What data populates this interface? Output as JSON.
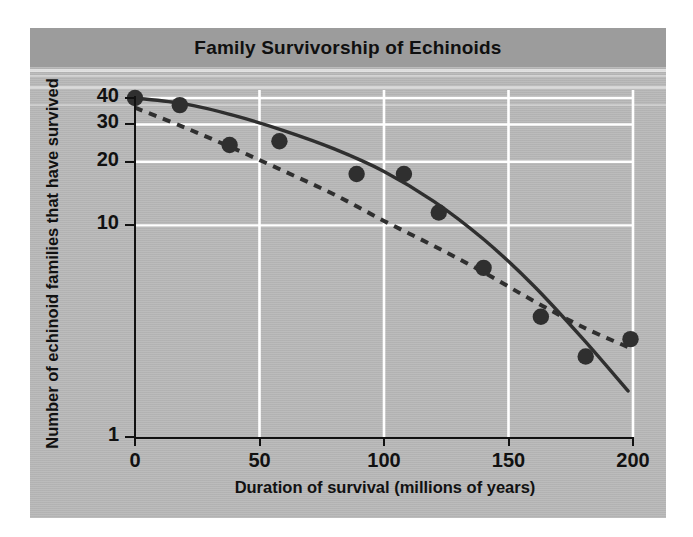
{
  "figure": {
    "title": "Family Survivorship of Echinoids",
    "panel_color": "#b9b9b9",
    "title_band_color": "#9c9c9c",
    "ink_color": "#2f2f2f",
    "grid_color": "#ffffff"
  },
  "chart_data": {
    "type": "scatter",
    "title": "Family Survivorship of Echinoids",
    "xlabel": "Duration of survival (millions of years)",
    "ylabel": "Number of echinoid families that have survived",
    "xlim": [
      0,
      200
    ],
    "ylim": [
      1,
      40
    ],
    "yscale": "log",
    "xticks": [
      0,
      50,
      100,
      150,
      200
    ],
    "xticklabels": [
      "0",
      "50",
      "100",
      "150",
      "200"
    ],
    "yticks": [
      1,
      10,
      20,
      30,
      40
    ],
    "yticklabels": [
      "1",
      "10",
      "20",
      "30",
      "40"
    ],
    "grid": true,
    "grid_color": "#ffffff",
    "legend": null,
    "points": [
      {
        "x": 0,
        "y": 40.0
      },
      {
        "x": 18,
        "y": 37.0
      },
      {
        "x": 38,
        "y": 24.0
      },
      {
        "x": 58,
        "y": 25.0
      },
      {
        "x": 89,
        "y": 17.5
      },
      {
        "x": 108,
        "y": 17.5
      },
      {
        "x": 122,
        "y": 11.5
      },
      {
        "x": 140,
        "y": 6.3
      },
      {
        "x": 163,
        "y": 3.7
      },
      {
        "x": 181,
        "y": 2.4
      },
      {
        "x": 199,
        "y": 2.9
      }
    ],
    "series": [
      {
        "name": "observed survivorship curve",
        "style": "solid",
        "x": [
          0,
          20,
          40,
          60,
          80,
          100,
          120,
          140,
          160,
          180,
          198
        ],
        "y": [
          40.0,
          37.5,
          33.0,
          28.0,
          23.0,
          18.0,
          13.0,
          8.6,
          5.2,
          2.9,
          1.65
        ]
      },
      {
        "name": "expected constant-rate line",
        "style": "dotted",
        "x": [
          0,
          20,
          40,
          60,
          80,
          100,
          120,
          140,
          160,
          180,
          200
        ],
        "y": [
          36.0,
          29.0,
          23.0,
          18.0,
          14.0,
          10.5,
          8.0,
          6.0,
          4.4,
          3.3,
          2.6
        ]
      }
    ]
  }
}
